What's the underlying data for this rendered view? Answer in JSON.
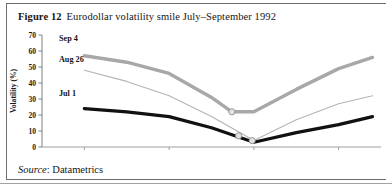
{
  "figure": {
    "number_label": "Figure 12",
    "title": "Eurodollar volatility smile July–September 1992",
    "source_word": "Source",
    "source_value": ": Datametrics"
  },
  "chart_data": {
    "type": "line",
    "title": "Eurodollar volatility smile July–September 1992",
    "xlabel": "",
    "ylabel": "Volatility (%)",
    "xlim": [
      4.5,
      6.5
    ],
    "ylim": [
      0,
      70
    ],
    "yticks": [
      0,
      10,
      20,
      30,
      40,
      50,
      60,
      70
    ],
    "ytick_labels": [
      "0",
      "10",
      "20",
      "30",
      "40",
      "50",
      "60",
      "70"
    ],
    "xticks": [
      4.75,
      5.25,
      5.75,
      6.25
    ],
    "xtick_labels": [
      "4.75",
      "5.25",
      "5.75",
      "6.25"
    ],
    "grid": false,
    "legend_position": "inline-left",
    "series": [
      {
        "name": "Sep 4",
        "color": "#a8a8a8",
        "width": 3.4,
        "x": [
          4.75,
          5.0,
          5.25,
          5.5,
          5.62,
          5.75,
          6.0,
          6.25,
          6.45
        ],
        "values": [
          57,
          53,
          46,
          31,
          22,
          22,
          36,
          49,
          56
        ]
      },
      {
        "name": "Aug 26",
        "color": "#b4b4b4",
        "width": 1.1,
        "x": [
          4.75,
          5.0,
          5.25,
          5.5,
          5.75,
          6.0,
          6.25,
          6.45
        ],
        "values": [
          48,
          41,
          32,
          19,
          4,
          17,
          27,
          32
        ]
      },
      {
        "name": "Jul 1",
        "color": "#111111",
        "width": 3.2,
        "x": [
          4.75,
          5.0,
          5.25,
          5.5,
          5.75,
          6.0,
          6.25,
          6.45
        ],
        "values": [
          24,
          22,
          19,
          12,
          3,
          9,
          14,
          19
        ]
      }
    ],
    "markers": [
      {
        "x": 5.62,
        "y": 22,
        "series": "Sep 4"
      },
      {
        "x": 5.66,
        "y": 7,
        "series": "Aug 26"
      },
      {
        "x": 5.74,
        "y": 4,
        "series": "Jul 1"
      }
    ],
    "annotations": [
      {
        "text": "Sep 4",
        "x": 4.6,
        "y": 66
      },
      {
        "text": "Aug 26",
        "x": 4.6,
        "y": 53
      },
      {
        "text": "Jul 1",
        "x": 4.6,
        "y": 32
      }
    ]
  }
}
